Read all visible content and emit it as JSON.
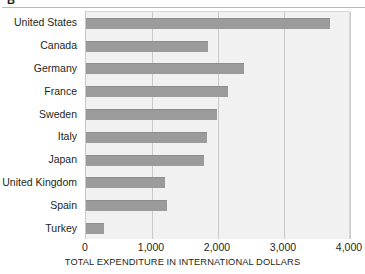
{
  "panel": {
    "letter": "B"
  },
  "chart_data": {
    "type": "bar",
    "orientation": "horizontal",
    "title": "",
    "xlabel": "TOTAL EXPENDITURE IN INTERNATIONAL DOLLARS",
    "ylabel": "",
    "categories": [
      "United States",
      "Canada",
      "Germany",
      "France",
      "Sweden",
      "Italy",
      "Japan",
      "United Kingdom",
      "Spain",
      "Turkey"
    ],
    "values": [
      3700,
      1850,
      2400,
      2150,
      1980,
      1830,
      1790,
      1200,
      1230,
      270
    ],
    "xlim": [
      0,
      4000
    ],
    "xticks": [
      0,
      1000,
      2000,
      3000,
      4000
    ],
    "xtick_labels": [
      "0",
      "1,000",
      "2,000",
      "3,000",
      "4,000"
    ],
    "grid": "vertical",
    "legend": "none",
    "bar_color": "#9b9b9b",
    "plot_background": "#f1f1f1"
  }
}
